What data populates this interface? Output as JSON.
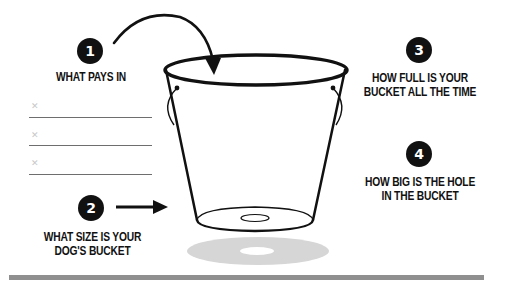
{
  "diagram": {
    "steps": [
      {
        "number": "1",
        "lines": [
          "WHAT PAYS IN"
        ]
      },
      {
        "number": "2",
        "lines": [
          "WHAT SIZE IS YOUR",
          "DOG'S BUCKET"
        ]
      },
      {
        "number": "3",
        "lines": [
          "HOW FULL IS YOUR",
          "BUCKET ALL THE TIME"
        ]
      },
      {
        "number": "4",
        "lines": [
          "HOW BIG IS THE HOLE",
          "IN THE BUCKET"
        ]
      }
    ],
    "input_lines": [
      {
        "marker": "✕"
      },
      {
        "marker": "✕"
      },
      {
        "marker": "✕"
      }
    ],
    "colors": {
      "ink": "#111111",
      "shadow": "#d6d6d6",
      "rule": "#8f8f8f",
      "line": "#6e6e6e",
      "marker": "#c8c8c8"
    }
  }
}
